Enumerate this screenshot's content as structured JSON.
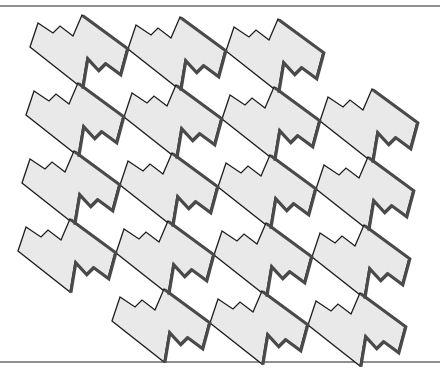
{
  "figure": {
    "title": "",
    "type": "tessellation",
    "width": 440,
    "height": 370,
    "colors": {
      "background": "#ffffff",
      "tile_fill": "#e9e9e9",
      "tile_outline": "#1e1e1e",
      "tile_shadow": "#4a4a4a",
      "rule_line": "#6a6a6a"
    },
    "rules": {
      "top_y": 6,
      "bottom_y": 362
    },
    "tile_shape": {
      "description": "Stepped parallelogram tile with zigzag top-left and bottom-right edges",
      "points_relative_to_peak": [
        [
          -52,
          32
        ],
        [
          -44,
          8
        ],
        [
          -29,
          18
        ],
        [
          -22,
          11
        ],
        [
          -9,
          21
        ],
        [
          0,
          0
        ],
        [
          45,
          33
        ],
        [
          38,
          59
        ],
        [
          23,
          48
        ],
        [
          16,
          55
        ],
        [
          5,
          43
        ],
        [
          0,
          73
        ]
      ]
    },
    "grid": {
      "origin_peak": [
        82,
        15
      ],
      "column_step": [
        98,
        2
      ],
      "row_step": [
        -4,
        68
      ],
      "rows": [
        {
          "row": 0,
          "columns": [
            0,
            1,
            2
          ]
        },
        {
          "row": 1,
          "columns": [
            0,
            1,
            2,
            3
          ]
        },
        {
          "row": 2,
          "columns": [
            0,
            1,
            2,
            3
          ]
        },
        {
          "row": 3,
          "columns": [
            0,
            1,
            2,
            3
          ]
        },
        {
          "row": 4,
          "columns": [
            1,
            2,
            3
          ]
        }
      ],
      "tile_count": 18
    }
  }
}
